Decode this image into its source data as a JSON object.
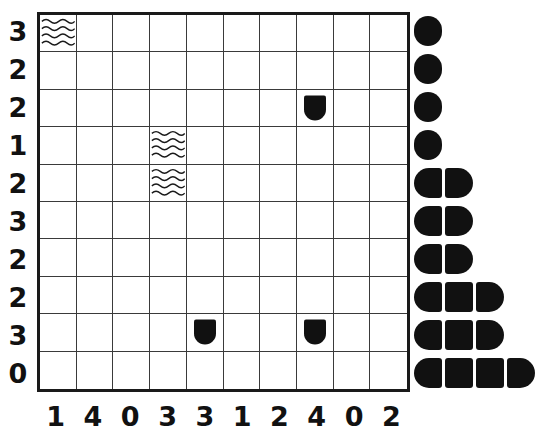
{
  "puzzle": {
    "kind": "nonogram-style-grid",
    "grid": {
      "rows": 10,
      "cols": 10
    },
    "row_clues": [
      "3",
      "2",
      "2",
      "1",
      "2",
      "3",
      "2",
      "2",
      "3",
      "0"
    ],
    "col_clues": [
      "1",
      "4",
      "0",
      "3",
      "3",
      "1",
      "2",
      "4",
      "0",
      "2"
    ],
    "marks": [
      {
        "row": 0,
        "col": 0,
        "glyph": "wavy-fill"
      },
      {
        "row": 2,
        "col": 7,
        "glyph": "shield-mark"
      },
      {
        "row": 3,
        "col": 3,
        "glyph": "wavy-fill"
      },
      {
        "row": 4,
        "col": 3,
        "glyph": "wavy-fill"
      },
      {
        "row": 8,
        "col": 4,
        "glyph": "shield-mark"
      },
      {
        "row": 8,
        "col": 7,
        "glyph": "shield-mark"
      }
    ],
    "colors": {
      "ink": "#111111",
      "grid_line": "#3a3a3a",
      "grid_border": "#1a1a1a",
      "background": "#ffffff"
    }
  },
  "chart_data": {
    "type": "bar",
    "title": "",
    "xlabel": "",
    "ylabel": "",
    "orientation": "horizontal",
    "categories": [
      "r1",
      "r2",
      "r3",
      "r4",
      "r5",
      "r6",
      "r7",
      "r8",
      "r9",
      "r10"
    ],
    "values": [
      1,
      1,
      1,
      1,
      2,
      2,
      2,
      3,
      3,
      4
    ],
    "xlim": [
      0,
      4
    ],
    "grid": false,
    "legend": "none"
  }
}
